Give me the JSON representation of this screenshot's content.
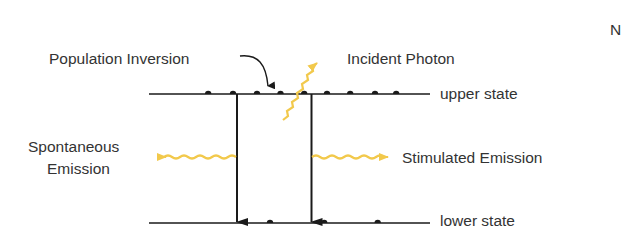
{
  "diagram": {
    "type": "laser energy level diagram",
    "labels": {
      "population_inversion": "Population Inversion",
      "incident_photon": "Incident Photon",
      "upper_state": "upper state",
      "lower_state": "lower state",
      "spontaneous_line1": "Spontaneous",
      "spontaneous_line2": "Emission",
      "stimulated_emission": "Stimulated Emission",
      "clipped_letter": "N"
    },
    "levels": [
      {
        "name": "upper state",
        "electron_count": 9
      },
      {
        "name": "lower state",
        "electron_count": 3
      }
    ],
    "transitions": [
      {
        "type": "Spontaneous Emission",
        "from": "upper state",
        "to": "lower state",
        "photon_direction": "left"
      },
      {
        "type": "Stimulated Emission",
        "from": "upper state",
        "to": "lower state",
        "photon_direction": "right",
        "trigger": "Incident Photon"
      }
    ],
    "colors": {
      "line": "#1a1a1a",
      "photon": "#f2c94c",
      "text": "#333333"
    }
  }
}
